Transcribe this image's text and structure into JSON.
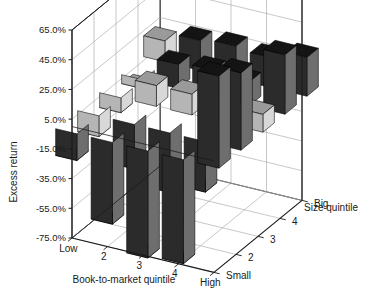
{
  "chart_data": {
    "type": "bar",
    "title": "",
    "xlabel": "Book-to-market quintile",
    "ylabel": "Excess return",
    "zlabel": "Size quintile",
    "ylim": [
      -75,
      65
    ],
    "ytick_step": 20,
    "grid": true,
    "legend": "none",
    "projection": "3d",
    "ytick_labels": [
      "65.0%",
      "45.0%",
      "25.0%",
      "5.0%",
      "-15.0%",
      "-35.0%",
      "-55.0%",
      "-75.0%"
    ],
    "ytick_values": [
      65,
      45,
      25,
      5,
      -15,
      -35,
      -55,
      -75
    ],
    "categories": [
      "Low",
      "2",
      "3",
      "4",
      "High"
    ],
    "depth_categories": [
      "Small",
      "2",
      "3",
      "4",
      "Big"
    ],
    "series": [
      {
        "name": "Small",
        "values": [
          -18,
          -55,
          -72,
          -70,
          62
        ]
      },
      {
        "name": "2",
        "values": [
          -14,
          -30,
          -40,
          -34,
          52
        ]
      },
      {
        "name": "3",
        "values": [
          -10,
          14,
          14,
          10,
          12
        ]
      },
      {
        "name": "4",
        "values": [
          -6,
          16,
          18,
          16,
          40
        ]
      },
      {
        "name": "Big",
        "values": [
          14,
          20,
          22,
          20,
          26
        ]
      }
    ]
  },
  "axes": {
    "y_title": "Excess return",
    "x_title": "Book-to-market quintile",
    "z_title": "Size quintile"
  },
  "colors": {
    "bar_front": "#2b2b2b",
    "bar_side": "#6e6e6e",
    "bar_top": "#141414",
    "bar_light_front": "#b5b5b5",
    "bar_light_side": "#d8d8d8",
    "bar_light_top": "#9a9a9a",
    "grid": "#9a9a9a",
    "axis": "#1a1a1a",
    "background": "#ffffff",
    "text": "#1a1a1a"
  }
}
